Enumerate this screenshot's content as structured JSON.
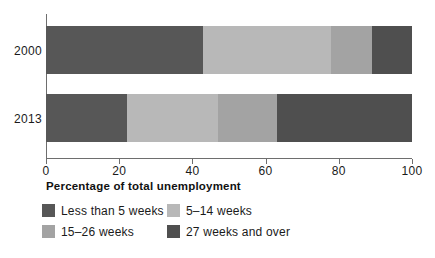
{
  "chart_data": {
    "type": "bar",
    "orientation": "horizontal",
    "stacked": true,
    "title": "",
    "xlabel": "Percentage of total unemployment",
    "ylabel": "",
    "xlim": [
      0,
      100
    ],
    "xticks": [
      0,
      20,
      40,
      60,
      80,
      100
    ],
    "xtick_labels": [
      "0",
      "20",
      "40",
      "60",
      "80",
      "100"
    ],
    "grid": false,
    "legend_position": "bottom",
    "categories": [
      "2000",
      "2013"
    ],
    "series": [
      {
        "name": "Less than 5 weeks",
        "color": "#575757",
        "values": [
          43,
          22
        ]
      },
      {
        "name": "5–14 weeks",
        "color": "#b8b8b8",
        "values": [
          35,
          25
        ]
      },
      {
        "name": "15–26 weeks",
        "color": "#a3a3a3",
        "values": [
          11,
          16
        ]
      },
      {
        "name": "27 weeks and over",
        "color": "#4f4f4f",
        "values": [
          11,
          37
        ]
      }
    ]
  },
  "axis": {
    "xlabel": "Percentage of total unemployment",
    "ticks": [
      {
        "value": 0,
        "label": "0"
      },
      {
        "value": 20,
        "label": "20"
      },
      {
        "value": 40,
        "label": "40"
      },
      {
        "value": 60,
        "label": "60"
      },
      {
        "value": 80,
        "label": "80"
      },
      {
        "value": 100,
        "label": "100"
      }
    ]
  },
  "bars": [
    {
      "category": "2000",
      "segments": [
        {
          "label": "Less than 5 weeks",
          "value": 43,
          "start": 0,
          "color": "#575757"
        },
        {
          "label": "5–14 weeks",
          "value": 35,
          "start": 43,
          "color": "#b8b8b8"
        },
        {
          "label": "15–26 weeks",
          "value": 11,
          "start": 78,
          "color": "#a3a3a3"
        },
        {
          "label": "27 weeks and over",
          "value": 11,
          "start": 89,
          "color": "#4f4f4f"
        }
      ]
    },
    {
      "category": "2013",
      "segments": [
        {
          "label": "Less than 5 weeks",
          "value": 22,
          "start": 0,
          "color": "#575757"
        },
        {
          "label": "5–14 weeks",
          "value": 25,
          "start": 22,
          "color": "#b8b8b8"
        },
        {
          "label": "15–26 weeks",
          "value": 16,
          "start": 47,
          "color": "#a3a3a3"
        },
        {
          "label": "27 weeks and over",
          "value": 37,
          "start": 63,
          "color": "#4f4f4f"
        }
      ]
    }
  ],
  "legend": {
    "rows": [
      [
        {
          "label": "Less than 5 weeks",
          "color": "#575757"
        },
        {
          "label": "5–14 weeks",
          "color": "#b8b8b8"
        }
      ],
      [
        {
          "label": "15–26 weeks",
          "color": "#a3a3a3"
        },
        {
          "label": "27 weeks and over",
          "color": "#4f4f4f"
        }
      ]
    ]
  },
  "colors": {
    "less_than_5_weeks": "#575757",
    "weeks_5_14": "#b8b8b8",
    "weeks_15_26": "#a3a3a3",
    "weeks_27_and_over": "#4f4f4f",
    "axis": "#6e6e6e",
    "text": "#1a1a1a",
    "background": "#ffffff"
  }
}
